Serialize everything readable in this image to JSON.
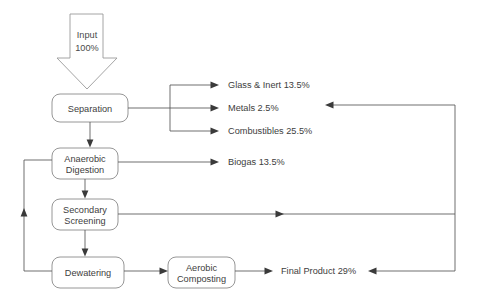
{
  "diagram": {
    "background_color": "#ffffff",
    "line_color": "#565656",
    "node_stroke_color": "#8a8a8a",
    "text_color": "#3d3d3d"
  },
  "input": {
    "name": "Input",
    "value": "100%",
    "line1": "Input",
    "line2": "100%"
  },
  "nodes": [
    {
      "id": "separation",
      "line1": "Separation",
      "line2": ""
    },
    {
      "id": "anaerobic-digestion",
      "line1": "Anaerobic",
      "line2": "Digestion"
    },
    {
      "id": "secondary-screening",
      "line1": "Secondary",
      "line2": "Screening"
    },
    {
      "id": "dewatering",
      "line1": "Dewatering",
      "line2": ""
    },
    {
      "id": "aerobic-composting",
      "line1": "Aerobic",
      "line2": "Composting"
    }
  ],
  "outputs": [
    {
      "id": "glass-inert",
      "label": "Glass & Inert 13.5%",
      "material": "Glass & Inert",
      "percent": "13.5%"
    },
    {
      "id": "metals",
      "label": "Metals 2.5%",
      "material": "Metals",
      "percent": "2.5%"
    },
    {
      "id": "combustibles",
      "label": "Combustibles 25.5%",
      "material": "Combustibles",
      "percent": "25.5%"
    },
    {
      "id": "biogas",
      "label": "Biogas 13.5%",
      "material": "Biogas",
      "percent": "13.5%"
    },
    {
      "id": "final-product",
      "label": "Final Product 29%",
      "material": "Final Product",
      "percent": "29%"
    }
  ]
}
